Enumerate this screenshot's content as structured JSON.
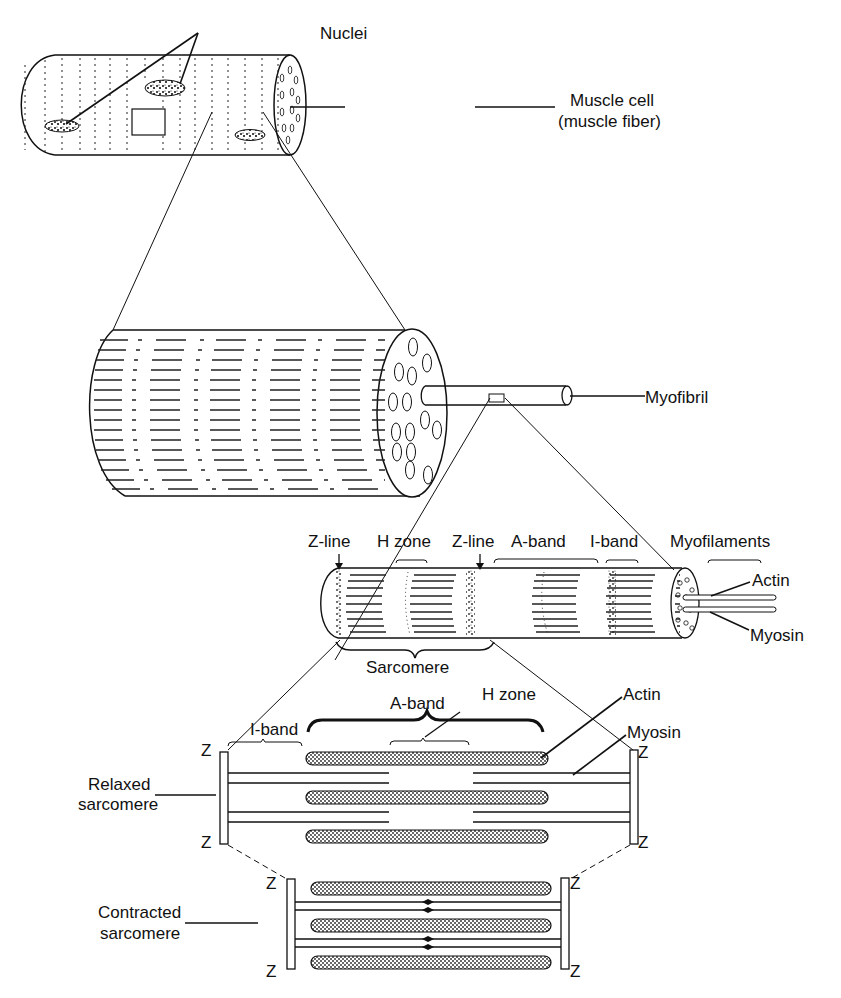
{
  "figure": {
    "panel1": {
      "nuclei_label": "Nuclei",
      "cell_label_line1": "Muscle cell",
      "cell_label_line2": "(muscle fiber)"
    },
    "panel2": {
      "myofibril_label": "Myofibril"
    },
    "panel3": {
      "zline_left_label": "Z-line",
      "hzone_label": "H zone",
      "zline_right_label": "Z-line",
      "aband_label": "A-band",
      "iband_label": "I-band",
      "myofilaments_label": "Myofilaments",
      "actin_label": "Actin",
      "myosin_label": "Myosin",
      "sarcomere_label": "Sarcomere"
    },
    "panel4": {
      "aband_label": "A-band",
      "hzone_label": "H zone",
      "iband_label": "I-band",
      "actin_label": "Actin",
      "myosin_label": "Myosin",
      "z_label": "Z",
      "relaxed_line1": "Relaxed",
      "relaxed_line2": "sarcomere"
    },
    "panel5": {
      "z_label": "Z",
      "contracted_line1": "Contracted",
      "contracted_line2": "sarcomere"
    }
  },
  "colors": {
    "ink": "#111111",
    "paper": "#ffffff"
  }
}
